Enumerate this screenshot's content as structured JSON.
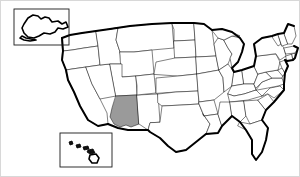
{
  "figure": {
    "kind": "choropleth-locator-map",
    "width": 300,
    "height": 177,
    "background_color": "#ffffff",
    "border_color": "#d8d8d8"
  },
  "legend": {
    "highlight_color": "#9a9a9a",
    "base_color": "#ffffff",
    "border_color": "#1a1a1a",
    "coastline_color": "#000000"
  },
  "highlighted": {
    "name": "Arizona",
    "abbr": "AZ",
    "fill": "#9a9a9a"
  },
  "insets": [
    {
      "id": "alaska-inset",
      "name": "Alaska",
      "abbr": "AK",
      "position": "top-left"
    },
    {
      "id": "hawaii-inset",
      "name": "Hawaii",
      "abbr": "HI",
      "position": "bottom-left"
    }
  ],
  "states": [
    {
      "abbr": "WA",
      "name": "Washington",
      "highlighted": false
    },
    {
      "abbr": "OR",
      "name": "Oregon",
      "highlighted": false
    },
    {
      "abbr": "CA",
      "name": "California",
      "highlighted": false
    },
    {
      "abbr": "NV",
      "name": "Nevada",
      "highlighted": false
    },
    {
      "abbr": "ID",
      "name": "Idaho",
      "highlighted": false
    },
    {
      "abbr": "MT",
      "name": "Montana",
      "highlighted": false
    },
    {
      "abbr": "WY",
      "name": "Wyoming",
      "highlighted": false
    },
    {
      "abbr": "UT",
      "name": "Utah",
      "highlighted": false
    },
    {
      "abbr": "AZ",
      "name": "Arizona",
      "highlighted": true
    },
    {
      "abbr": "NM",
      "name": "New Mexico",
      "highlighted": false
    },
    {
      "abbr": "CO",
      "name": "Colorado",
      "highlighted": false
    },
    {
      "abbr": "ND",
      "name": "North Dakota",
      "highlighted": false
    },
    {
      "abbr": "SD",
      "name": "South Dakota",
      "highlighted": false
    },
    {
      "abbr": "NE",
      "name": "Nebraska",
      "highlighted": false
    },
    {
      "abbr": "KS",
      "name": "Kansas",
      "highlighted": false
    },
    {
      "abbr": "OK",
      "name": "Oklahoma",
      "highlighted": false
    },
    {
      "abbr": "TX",
      "name": "Texas",
      "highlighted": false
    },
    {
      "abbr": "MN",
      "name": "Minnesota",
      "highlighted": false
    },
    {
      "abbr": "IA",
      "name": "Iowa",
      "highlighted": false
    },
    {
      "abbr": "MO",
      "name": "Missouri",
      "highlighted": false
    },
    {
      "abbr": "AR",
      "name": "Arkansas",
      "highlighted": false
    },
    {
      "abbr": "LA",
      "name": "Louisiana",
      "highlighted": false
    },
    {
      "abbr": "WI",
      "name": "Wisconsin",
      "highlighted": false
    },
    {
      "abbr": "IL",
      "name": "Illinois",
      "highlighted": false
    },
    {
      "abbr": "MI",
      "name": "Michigan",
      "highlighted": false
    },
    {
      "abbr": "IN",
      "name": "Indiana",
      "highlighted": false
    },
    {
      "abbr": "OH",
      "name": "Ohio",
      "highlighted": false
    },
    {
      "abbr": "KY",
      "name": "Kentucky",
      "highlighted": false
    },
    {
      "abbr": "TN",
      "name": "Tennessee",
      "highlighted": false
    },
    {
      "abbr": "MS",
      "name": "Mississippi",
      "highlighted": false
    },
    {
      "abbr": "AL",
      "name": "Alabama",
      "highlighted": false
    },
    {
      "abbr": "GA",
      "name": "Georgia",
      "highlighted": false
    },
    {
      "abbr": "FL",
      "name": "Florida",
      "highlighted": false
    },
    {
      "abbr": "SC",
      "name": "South Carolina",
      "highlighted": false
    },
    {
      "abbr": "NC",
      "name": "North Carolina",
      "highlighted": false
    },
    {
      "abbr": "VA",
      "name": "Virginia",
      "highlighted": false
    },
    {
      "abbr": "WV",
      "name": "West Virginia",
      "highlighted": false
    },
    {
      "abbr": "MD",
      "name": "Maryland",
      "highlighted": false
    },
    {
      "abbr": "DE",
      "name": "Delaware",
      "highlighted": false
    },
    {
      "abbr": "PA",
      "name": "Pennsylvania",
      "highlighted": false
    },
    {
      "abbr": "NJ",
      "name": "New Jersey",
      "highlighted": false
    },
    {
      "abbr": "NY",
      "name": "New York",
      "highlighted": false
    },
    {
      "abbr": "CT",
      "name": "Connecticut",
      "highlighted": false
    },
    {
      "abbr": "RI",
      "name": "Rhode Island",
      "highlighted": false
    },
    {
      "abbr": "MA",
      "name": "Massachusetts",
      "highlighted": false
    },
    {
      "abbr": "VT",
      "name": "Vermont",
      "highlighted": false
    },
    {
      "abbr": "NH",
      "name": "New Hampshire",
      "highlighted": false
    },
    {
      "abbr": "ME",
      "name": "Maine",
      "highlighted": false
    }
  ]
}
